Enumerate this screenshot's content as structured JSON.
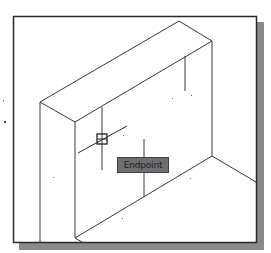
{
  "viewport": {
    "description": "CAD drawing viewport with isometric box",
    "border_color": "#2a2a2a",
    "shadow_color": "#8a8a8a",
    "line_color": "#3a3a3a"
  },
  "cursor": {
    "icon": "crosshair-icon",
    "snap_marker": "endpoint-snap-marker-icon",
    "x": 102,
    "y": 139
  },
  "tooltip": {
    "label": "Endpoint",
    "background": "#6f6f6f",
    "text_color": "#1e1e1e"
  }
}
